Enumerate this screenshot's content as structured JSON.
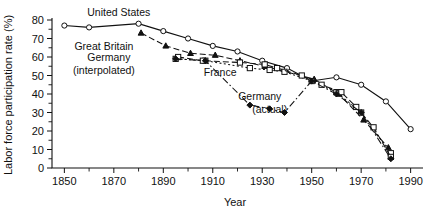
{
  "chart_data": {
    "type": "line",
    "title": "",
    "xlabel": "Year",
    "ylabel": "Labor force participation rate (%)",
    "xlim": [
      1845,
      1995
    ],
    "ylim": [
      0,
      80
    ],
    "grid": false,
    "legend_position": "inline-annotations",
    "x_tick_labels": [
      "1850",
      "1870",
      "1890",
      "1910",
      "1930",
      "1950",
      "1970",
      "1990"
    ],
    "x_tick_values": [
      1850,
      1870,
      1890,
      1910,
      1930,
      1950,
      1970,
      1990
    ],
    "x_minor_tick_values": [
      1860,
      1880,
      1900,
      1920,
      1940,
      1960,
      1980
    ],
    "y_tick_labels": [
      "0",
      "10",
      "20",
      "30",
      "40",
      "50",
      "60",
      "70",
      "80"
    ],
    "y_tick_values": [
      0,
      10,
      20,
      30,
      40,
      50,
      60,
      70,
      80
    ],
    "y_minor_tick_values": [
      5,
      15,
      25,
      35,
      45,
      55,
      65,
      75
    ],
    "series": [
      {
        "name": "United States",
        "marker": "open-circle",
        "linestyle": "solid",
        "x": [
          1850,
          1860,
          1880,
          1890,
          1900,
          1910,
          1920,
          1930,
          1940,
          1950,
          1960,
          1970,
          1980,
          1990
        ],
        "values": [
          77,
          76,
          78,
          74,
          70,
          66,
          63,
          58,
          54,
          47,
          49,
          45,
          36,
          21
        ]
      },
      {
        "name": "Great Britain",
        "marker": "filled-triangle",
        "linestyle": "dashed",
        "x": [
          1881,
          1891,
          1901,
          1911,
          1921,
          1931,
          1951,
          1961,
          1971,
          1981
        ],
        "values": [
          73,
          66,
          62,
          61,
          58,
          55,
          48,
          40,
          26,
          11
        ]
      },
      {
        "name": "Germany (interpolated)",
        "marker": "open-square",
        "linestyle": "dotted",
        "x": [
          1895,
          1907,
          1925,
          1933,
          1939,
          1950,
          1960,
          1970,
          1982
        ],
        "values": [
          59,
          58,
          54,
          53,
          52,
          47,
          41,
          30,
          8
        ]
      },
      {
        "name": "France",
        "marker": "open-square",
        "linestyle": "dashed",
        "x": [
          1896,
          1906,
          1921,
          1931,
          1936,
          1946,
          1954,
          1962,
          1968,
          1975,
          1982
        ],
        "values": [
          60,
          58,
          57,
          56,
          54,
          50,
          45,
          41,
          33,
          22,
          6
        ]
      },
      {
        "name": "Germany (actual)",
        "marker": "filled-diamond",
        "linestyle": "dashdot",
        "x": [
          1895,
          1907,
          1925,
          1933,
          1939,
          1950,
          1960,
          1970,
          1982
        ],
        "values": [
          59,
          58,
          34,
          32,
          30,
          47,
          40,
          30,
          5
        ]
      }
    ],
    "annotations": [
      {
        "name": "united-states",
        "text": "United States",
        "x": 1872,
        "y": 82
      },
      {
        "name": "great-britain",
        "text": "Great Britain",
        "x": 1866,
        "y": 64
      },
      {
        "name": "germany-label",
        "text": "Germany",
        "x": 1868,
        "y": 58
      },
      {
        "name": "interpolated-label",
        "text": "(interpolated)",
        "x": 1866,
        "y": 51
      },
      {
        "name": "france",
        "text": "France",
        "x": 1913,
        "y": 50
      },
      {
        "name": "germany-actual-1",
        "text": "Germany",
        "x": 1929,
        "y": 37
      },
      {
        "name": "germany-actual-2",
        "text": "(actual)",
        "x": 1933,
        "y": 30
      }
    ]
  }
}
